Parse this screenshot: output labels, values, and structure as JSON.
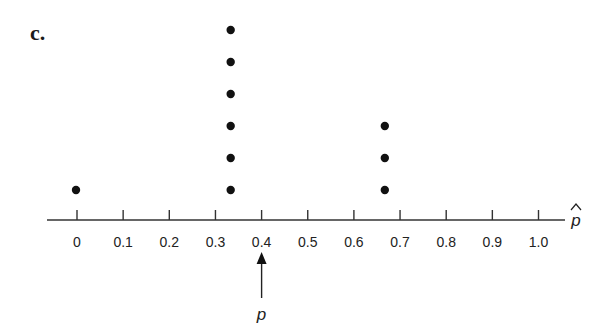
{
  "panel": {
    "label": "c."
  },
  "chart_data": {
    "type": "scatter",
    "subtype": "dot-plot",
    "title": "",
    "xlabel": "p̂",
    "ylabel": "",
    "xlim": [
      0,
      1.0
    ],
    "ticks": [
      "0",
      "0.1",
      "0.2",
      "0.3",
      "0.4",
      "0.5",
      "0.6",
      "0.7",
      "0.8",
      "0.9",
      "1.0"
    ],
    "tick_values": [
      0,
      0.1,
      0.2,
      0.3,
      0.4,
      0.5,
      0.6,
      0.7,
      0.8,
      0.9,
      1.0
    ],
    "points": [
      {
        "x": 0,
        "count": 1
      },
      {
        "x": 0.333,
        "count": 6
      },
      {
        "x": 0.667,
        "count": 3
      }
    ],
    "grid": false,
    "annotations": [
      {
        "type": "arrow",
        "x": 0.4,
        "label": "p",
        "direction": "up"
      }
    ]
  }
}
